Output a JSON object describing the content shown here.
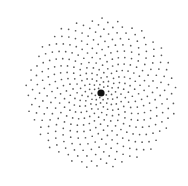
{
  "figure": {
    "background": "#ffffff",
    "dot_color": "#5a5a5a",
    "center_dot_color": "#111111",
    "center": {
      "x": 101,
      "y": 93
    },
    "center_dot_radius": 3.6,
    "dot_count": 420,
    "dot_radius": 0.85,
    "golden_angle_deg": 137.508,
    "radial_scale": 1.45,
    "radial_exponent": 0.655,
    "max_radius": 78
  }
}
